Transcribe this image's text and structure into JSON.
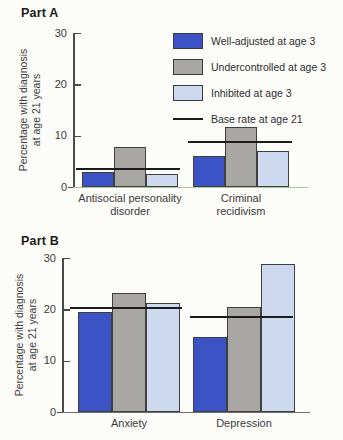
{
  "page": {
    "background": "#fcfcf9"
  },
  "colors": {
    "well_adjusted": "#3b53c4",
    "undercontrolled": "#a9a7a3",
    "inhibited": "#cdd9ef",
    "base_rate_line": "#1b1b1b",
    "axis": "#4a4a4a",
    "part_a_baseline": "#a5c89d",
    "part_b_baseline": "#6e6e6e"
  },
  "legend": {
    "items": [
      {
        "label": "Well-adjusted at age 3",
        "color": "#3b53c4"
      },
      {
        "label": "Undercontrolled at age 3",
        "color": "#a9a7a3"
      },
      {
        "label": "Inhibited at age 3",
        "color": "#cdd9ef"
      }
    ],
    "line_item": {
      "label": "Base rate at age 21"
    }
  },
  "chart_data": [
    {
      "type": "bar",
      "title": "Part A",
      "ylabel": "Percentage with diagnosis at age 21 years",
      "ylabel_lines": [
        "Percentage with diagnosis",
        "at age 21 years"
      ],
      "ylim": [
        0,
        30
      ],
      "yticks": [
        30,
        20,
        10,
        0
      ],
      "grid": false,
      "legend_position": "upper right",
      "categories": [
        "Antisocial personality disorder",
        "Criminal recidivism"
      ],
      "category_label_lines": [
        [
          "Antisocial personality",
          "disorder"
        ],
        [
          "Criminal",
          "recidivism"
        ]
      ],
      "series": [
        {
          "name": "Well-adjusted at age 3",
          "values": [
            2.9,
            6.0
          ]
        },
        {
          "name": "Undercontrolled at age 3",
          "values": [
            7.7,
            11.6
          ]
        },
        {
          "name": "Inhibited at age 3",
          "values": [
            2.5,
            7.0
          ]
        }
      ],
      "base_rate_at_age_21": [
        3.6,
        8.8
      ]
    },
    {
      "type": "bar",
      "title": "Part B",
      "ylabel": "Percentage with diagnosis at age 21 years",
      "ylabel_lines": [
        "Percentage with diagnosis",
        "at age 21 years"
      ],
      "ylim": [
        0,
        30
      ],
      "yticks": [
        30,
        20,
        10,
        0
      ],
      "grid": false,
      "categories": [
        "Anxiety",
        "Depression"
      ],
      "category_label_lines": [
        [
          "Anxiety"
        ],
        [
          "Depression"
        ]
      ],
      "series": [
        {
          "name": "Well-adjusted at age 3",
          "values": [
            19.4,
            14.7
          ]
        },
        {
          "name": "Undercontrolled at age 3",
          "values": [
            23.2,
            20.4
          ]
        },
        {
          "name": "Inhibited at age 3",
          "values": [
            21.2,
            28.8
          ]
        }
      ],
      "base_rate_at_age_21": [
        20.3,
        18.6
      ]
    }
  ]
}
